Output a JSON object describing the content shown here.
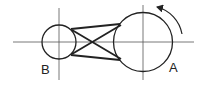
{
  "diagram": {
    "type": "crossed-belt pulley drive",
    "pulleys": [
      {
        "label": "B",
        "cx": 59,
        "cy": 42,
        "r": 17
      },
      {
        "label": "A",
        "cx": 143,
        "cy": 42,
        "r": 29
      }
    ],
    "rotation_arrow": {
      "pulley": "A",
      "direction": "counterclockwise"
    },
    "colors": {
      "stroke": "#222222",
      "background": "#ffffff"
    }
  }
}
